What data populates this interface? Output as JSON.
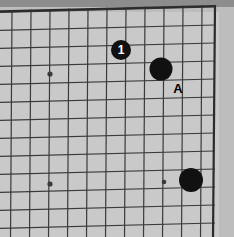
{
  "figure": {
    "kind": "go-board-diagram",
    "width": 234,
    "height": 237,
    "board_background_color": "#c9c9c9",
    "paper_margin_color": "#bdbdbd",
    "top_shadow_color": "#8d8d8d",
    "grid_line_color": "#3a3a3a",
    "edge_line_color": "#2b2b2b",
    "stone_black_color": "#111111",
    "stone_number_color": "#ffffff",
    "annotation_color": "#000000"
  },
  "grid": {
    "spacing_px": 19,
    "skew_note": "scan tilt: rows rise ~5px from left to right",
    "vertical_line_x": [
      12,
      31,
      50,
      69,
      88,
      107,
      126,
      145,
      164,
      183,
      202,
      215
    ],
    "horizontal_line_y": [
      12,
      30,
      48,
      66,
      84,
      102,
      120,
      138,
      156,
      174,
      192,
      210,
      228
    ],
    "edges": {
      "top_y": 11,
      "right_x": 215,
      "left_open": true,
      "bottom_open": true
    }
  },
  "star_points": [
    {
      "name": "star-point-upper-left",
      "x": 50,
      "y": 74,
      "r": 2.6
    },
    {
      "name": "star-point-lower-left",
      "x": 50,
      "y": 184,
      "r": 2.6
    },
    {
      "name": "star-point-lower-right",
      "x": 164,
      "y": 182,
      "r": 2.3
    }
  ],
  "stones": [
    {
      "name": "black-stone-move-1",
      "color": "black",
      "x": 121,
      "y": 50,
      "r": 10,
      "label": "1",
      "label_color": "#ffffff",
      "label_size": 12
    },
    {
      "name": "black-stone-upper-right",
      "color": "black",
      "x": 161,
      "y": 69,
      "r": 11.5,
      "label": "",
      "label_color": "",
      "label_size": 0
    },
    {
      "name": "black-stone-lower-right",
      "color": "black",
      "x": 191,
      "y": 180,
      "r": 12,
      "label": "",
      "label_color": "",
      "label_size": 0
    }
  ],
  "annotations": [
    {
      "name": "point-label-a",
      "text": "A",
      "x": 178,
      "y": 88,
      "size": 13,
      "color": "#000000"
    }
  ],
  "chart_data": {
    "type": "table",
    "xlabel": "",
    "ylabel": "",
    "categories": [
      "stone-1",
      "stone-upper-right",
      "stone-lower-right",
      "label-A"
    ],
    "values": [
      1,
      1,
      1,
      0
    ]
  }
}
